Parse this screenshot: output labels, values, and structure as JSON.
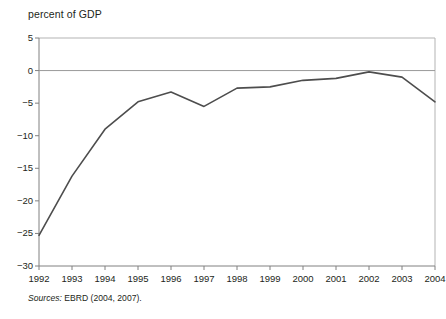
{
  "figure": {
    "axis_title": "percent of GDP",
    "source_lead": "Sources:",
    "source_text": "EBRD (2004, 2007)."
  },
  "chart_data": {
    "type": "line",
    "title": "",
    "xlabel": "",
    "ylabel": "percent of GDP",
    "categories": [
      "1992",
      "1993",
      "1994",
      "1995",
      "1996",
      "1997",
      "1998",
      "1999",
      "2000",
      "2001",
      "2002",
      "2003",
      "2004"
    ],
    "x": [
      1992,
      1993,
      1994,
      1995,
      1996,
      1997,
      1998,
      1999,
      2000,
      2001,
      2002,
      2003,
      2004
    ],
    "values": [
      -25.3,
      -16.2,
      -9.0,
      -4.8,
      -3.3,
      -5.5,
      -2.7,
      -2.5,
      -1.5,
      -1.2,
      -0.2,
      -1.0,
      -4.8
    ],
    "series": [
      {
        "name": "percent of GDP",
        "values": [
          -25.3,
          -16.2,
          -9.0,
          -4.8,
          -3.3,
          -5.5,
          -2.7,
          -2.5,
          -1.5,
          -1.2,
          -0.2,
          -1.0,
          -4.8
        ]
      }
    ],
    "ylim": [
      -30,
      5
    ],
    "yticks": [
      5,
      0,
      -5,
      -10,
      -15,
      -20,
      -25,
      -30
    ],
    "ytick_labels": [
      "5",
      "0",
      "−5",
      "−10",
      "−15",
      "−20",
      "−25",
      "−30"
    ],
    "xlim": [
      1992,
      2004
    ],
    "grid": false,
    "legend": "none",
    "zero_line": 0,
    "line_color": "#4d4d4d",
    "frame_color": "#b3b3b3",
    "zero_line_color": "#999999"
  }
}
